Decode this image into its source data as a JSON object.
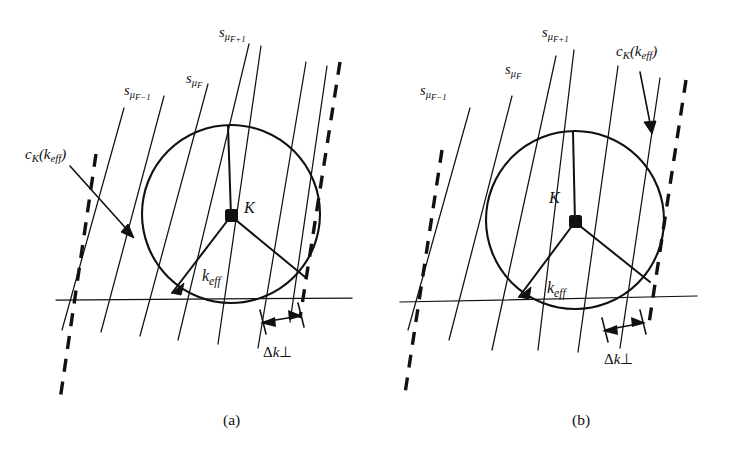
{
  "figure": {
    "background_color": "#ffffff",
    "ink_color": "#111111",
    "panels": [
      {
        "id": "a",
        "caption": "(a)",
        "labels": {
          "spoke_minus": "s",
          "spoke_minus_sub": "μ",
          "spoke_minus_sub2": "F−1",
          "spoke_mid": "s",
          "spoke_mid_sub": "μ",
          "spoke_mid_sub2": "F",
          "spoke_plus": "s",
          "spoke_plus_sub": "μ",
          "spoke_plus_sub2": "F+1",
          "circle_label": "c",
          "circle_label_sub": "K",
          "circle_label_arg": "(k",
          "circle_label_arg_sub": "eff",
          "circle_label_arg_end": ")",
          "center_point": "K",
          "vector": "k",
          "vector_sub": "eff",
          "spacing_delta": "Δ",
          "spacing_k": "k",
          "spacing_perp": "⊥"
        }
      },
      {
        "id": "b",
        "caption": "(b)",
        "labels": {
          "spoke_minus": "s",
          "spoke_minus_sub": "μ",
          "spoke_minus_sub2": "F−1",
          "spoke_mid": "s",
          "spoke_mid_sub": "μ",
          "spoke_mid_sub2": "F",
          "spoke_plus": "s",
          "spoke_plus_sub": "μ",
          "spoke_plus_sub2": "F+1",
          "circle_label": "c",
          "circle_label_sub": "K",
          "circle_label_arg": "(k",
          "circle_label_arg_sub": "eff",
          "circle_label_arg_end": ")",
          "center_point": "K",
          "vector": "k",
          "vector_sub": "eff",
          "spacing_delta": "Δ",
          "spacing_k": "k",
          "spacing_perp": "⊥"
        }
      }
    ]
  }
}
